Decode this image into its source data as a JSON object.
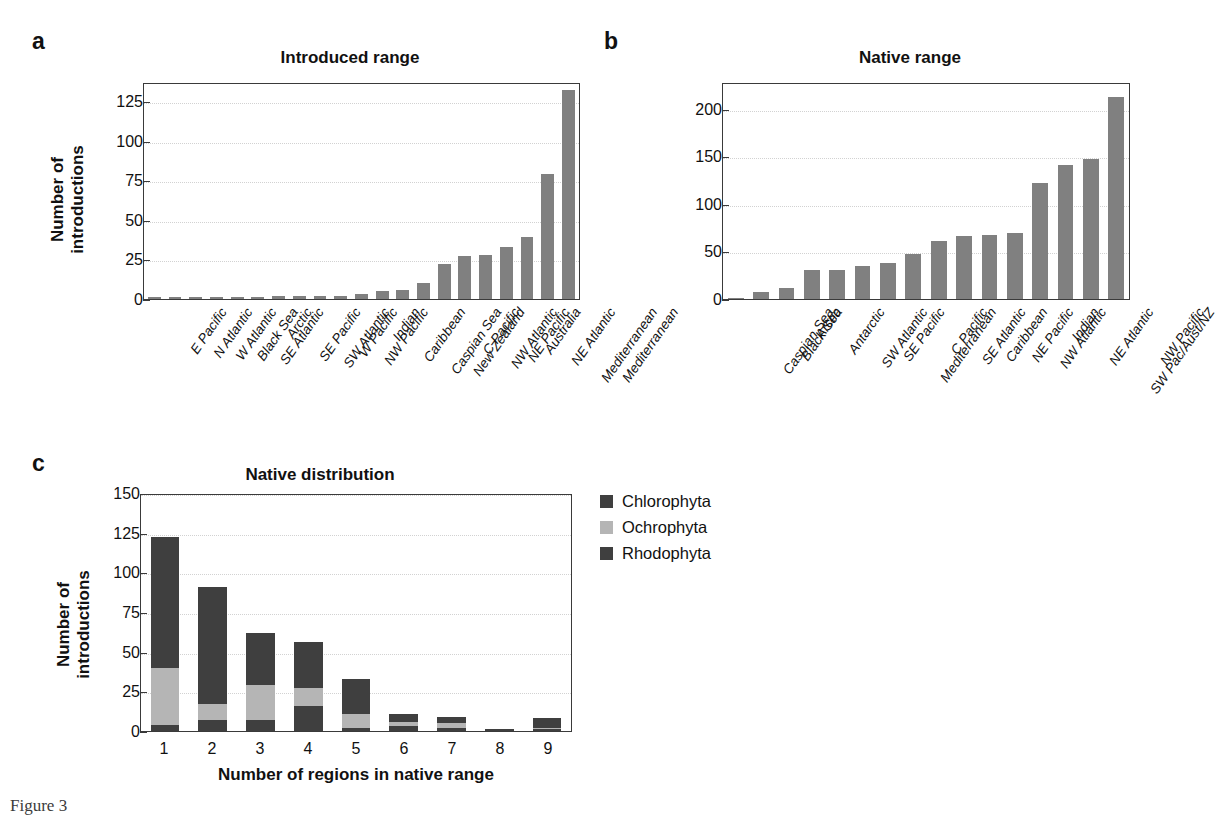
{
  "figure": {
    "caption": "Figure 3"
  },
  "panels": {
    "a": {
      "letter": "a",
      "title": "Introduced range",
      "ylabel_line1": "Number of",
      "ylabel_line2": "introductions"
    },
    "b": {
      "letter": "b",
      "title": "Native range"
    },
    "c": {
      "letter": "c",
      "title": "Native distribution",
      "ylabel_line1": "Number of",
      "ylabel_line2": "introductions",
      "xlabel": "Number of regions in native range"
    }
  },
  "legend": {
    "items": [
      {
        "label": "Chlorophyta",
        "color": "#3f3f3f"
      },
      {
        "label": "Ochrophyta",
        "color": "#b5b5b5"
      },
      {
        "label": "Rhodophyta",
        "color": "#3f3f3f"
      }
    ]
  },
  "chart_data": [
    {
      "id": "a",
      "type": "bar",
      "title": "Introduced range",
      "xlabel": "",
      "ylabel": "Number of introductions",
      "ylim": [
        0,
        137
      ],
      "yticks": [
        0,
        25,
        50,
        75,
        100,
        125
      ],
      "grid": true,
      "bar_color": "#808080",
      "categories": [
        "E Pacific",
        "N Atlantic",
        "W Atlantic",
        "Black Sea",
        "SE Atlantic",
        "Arctic",
        "SE Pacific",
        "SW Atlantic",
        "W Pacific",
        "NW Pacific",
        "Indian",
        "Caribbean",
        "Caspian Sea",
        "New Zealand",
        "C Pacific",
        "NW Atlantic",
        "NE Pacific",
        "Australia",
        "NE Atlantic",
        "Mediterranean"
      ],
      "values": [
        1,
        1,
        1,
        1,
        1,
        1,
        2,
        2,
        2,
        2,
        3,
        5,
        6,
        10,
        22,
        27,
        28,
        33,
        39,
        79
      ]
    },
    {
      "id": "a2",
      "type": "bar",
      "note": "final bar of panel a",
      "categories": [
        "Mediterranean"
      ],
      "values": [
        132
      ]
    },
    {
      "id": "b",
      "type": "bar",
      "title": "Native range",
      "xlabel": "",
      "ylabel": "",
      "ylim": [
        0,
        228
      ],
      "yticks": [
        0,
        50,
        100,
        150,
        200
      ],
      "grid": true,
      "bar_color": "#808080",
      "categories": [
        "Caspian Sea",
        "Black Sea",
        "Arctic",
        "Antarctic",
        "SW Atlantic",
        "SE Pacific",
        "Mediterranean",
        "C Pacific",
        "SE Atlantic",
        "Caribbean",
        "NE Pacific",
        "NW Atlantic",
        "Indian",
        "NE Atlantic",
        "SW Pac/Aust/NZ",
        "NW Pacific"
      ],
      "values": [
        0,
        7,
        12,
        30,
        30,
        35,
        38,
        47,
        61,
        66,
        67,
        69,
        122,
        141,
        147,
        212
      ]
    },
    {
      "id": "c",
      "type": "bar",
      "stacked": true,
      "title": "Native distribution",
      "xlabel": "Number of regions in native range",
      "ylabel": "Number of introductions",
      "ylim": [
        0,
        150
      ],
      "yticks": [
        0,
        25,
        50,
        75,
        100,
        125,
        150
      ],
      "grid": true,
      "legend_position": "right",
      "categories": [
        "1",
        "2",
        "3",
        "4",
        "5",
        "6",
        "7",
        "8",
        "9"
      ],
      "series": [
        {
          "name": "Chlorophyta",
          "color": "#3f3f3f",
          "values": [
            4,
            7,
            7,
            16,
            2,
            3,
            2,
            1,
            1
          ]
        },
        {
          "name": "Ochrophyta",
          "color": "#b5b5b5",
          "values": [
            36,
            10,
            22,
            11,
            9,
            3,
            3,
            0,
            1
          ]
        },
        {
          "name": "Rhodophyta",
          "color": "#3f3f3f",
          "values": [
            82,
            74,
            33,
            29,
            22,
            5,
            4,
            0,
            6
          ]
        }
      ],
      "totals": [
        122,
        91,
        62,
        56,
        33,
        11,
        9,
        1,
        8
      ]
    }
  ]
}
